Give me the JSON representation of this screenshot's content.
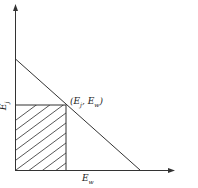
{
  "diagram": {
    "type": "budget-constraint-with-shaded-rectangle",
    "axes": {
      "x_label": {
        "base": "E",
        "sub": "w"
      },
      "y_label": {
        "base": "E",
        "sub": "j"
      }
    },
    "point_label": {
      "open": "(",
      "first_base": "E",
      "first_sub": "j",
      "sep": ", ",
      "second_base": "E",
      "second_sub": "w",
      "close": ")"
    },
    "colors": {
      "line": "#333333",
      "background": "#ffffff"
    }
  }
}
